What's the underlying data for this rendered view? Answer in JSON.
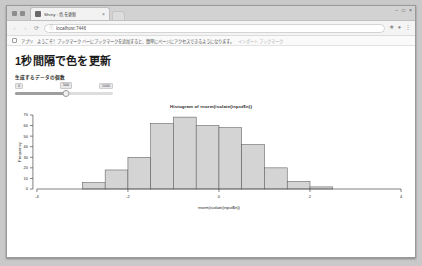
{
  "browser": {
    "tab": {
      "title": "Shiny : 色を更新",
      "favicon_icon": "page-favicon-icon",
      "close_icon": "close-icon"
    },
    "new_tab_icon": "new-tab-icon",
    "window_controls": {
      "minimize": "−",
      "maximize": "□",
      "close": "×"
    },
    "nav": {
      "back_icon": "‹",
      "forward_icon": "›",
      "reload_icon": "⟳"
    },
    "omnibox": {
      "lock_icon": "info-icon",
      "url": "localhost:7446",
      "placeholder": "検索または URL を入力"
    },
    "toolbar_right": {
      "star_icon": "★",
      "profile_icon": "●",
      "menu_icon": "⋮"
    },
    "bookmarks": {
      "folder_icon": "bookmark-folder-icon",
      "label": "アプリ",
      "items": [
        "ようこそ！ブックマーク バーにブックマークを追加すると、簡単にページにアクセスできるようになります。",
        "インポート ブックマーク"
      ]
    }
  },
  "page": {
    "title": "1秒間隔で色を更新",
    "slider": {
      "label": "生成するデータの個数",
      "min_label": "0",
      "max_label": "1000",
      "value": "500",
      "value_percent": 52
    }
  },
  "chart_data": {
    "type": "bar",
    "title": "Histogram of rnorm(isolate(input$n))",
    "xlabel": "rnorm(isolate(input$n))",
    "ylabel": "Frequency",
    "categories": [
      "-4 to -3.5",
      "-3.5 to -3",
      "-3 to -2.5",
      "-2.5 to -2",
      "-2 to -1.5",
      "-1.5 to -1",
      "-1 to -0.5",
      "-0.5 to 0",
      "0 to 0.5",
      "0.5 to 1",
      "1 to 1.5",
      "1.5 to 2",
      "2 to 2.5",
      "2.5 to 3",
      "3 to 3.5"
    ],
    "bin_centers": [
      -3.75,
      -3.25,
      -2.75,
      -2.25,
      -1.75,
      -1.25,
      -0.75,
      -0.25,
      0.25,
      0.75,
      1.25,
      1.75,
      2.25,
      2.75,
      3.25
    ],
    "values": [
      0,
      0,
      6,
      18,
      30,
      62,
      68,
      60,
      58,
      42,
      20,
      7,
      2,
      0,
      0
    ],
    "xlim": [
      -4,
      4
    ],
    "ylim": [
      0,
      70
    ],
    "xticks": [
      "-4",
      "-2",
      "0",
      "2",
      "4"
    ],
    "xtick_values": [
      -4,
      -2,
      0,
      2,
      4
    ],
    "yticks": [
      "0",
      "10",
      "20",
      "30",
      "40",
      "50",
      "60",
      "70"
    ],
    "ytick_values": [
      0,
      10,
      20,
      30,
      40,
      50,
      60,
      70
    ],
    "grid": false,
    "legend": "none",
    "bar_fill": "#d4d4d4",
    "bar_stroke": "#5a5a5a"
  }
}
